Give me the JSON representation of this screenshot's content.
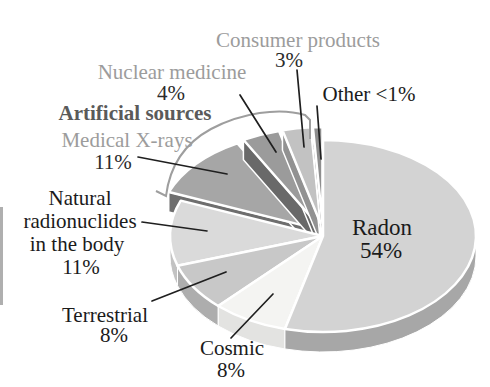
{
  "chart_data": {
    "type": "pie",
    "title": "",
    "style": "3d-exploded-pie",
    "legend_position": "callout-labels",
    "total": 100,
    "group_label": {
      "text": "Artificial sources",
      "color": "#5a5a5a"
    },
    "slices": [
      {
        "id": "radon",
        "label": "Radon",
        "label_lines": [
          "Radon"
        ],
        "pct": "54%",
        "value": 54,
        "value_display": "54%",
        "exploded": false,
        "color_top": "#d3d3d3",
        "color_side": "#a7a7a7",
        "label_color": "#1b1b1b",
        "pct_color": "#1b1b1b"
      },
      {
        "id": "cosmic",
        "label": "Cosmic",
        "label_lines": [
          "Cosmic"
        ],
        "pct": "8%",
        "value": 8,
        "value_display": "8%",
        "exploded": false,
        "color_top": "#f4f4f2",
        "color_side": "#e3e3e1",
        "label_color": "#1b1b1b",
        "pct_color": "#1b1b1b"
      },
      {
        "id": "terrestrial",
        "label": "Terrestrial",
        "label_lines": [
          "Terrestrial"
        ],
        "pct": "8%",
        "value": 8,
        "value_display": "8%",
        "exploded": false,
        "color_top": "#c8c8c8",
        "color_side": "#adadad",
        "label_color": "#1b1b1b",
        "pct_color": "#1b1b1b"
      },
      {
        "id": "natural",
        "label": "Natural radionuclides in the body",
        "label_lines": [
          "Natural",
          "radionuclides",
          "in the body"
        ],
        "pct": "11%",
        "value": 11,
        "value_display": "11%",
        "exploded": false,
        "color_top": "#dadada",
        "color_side": "#c2c2c2",
        "label_color": "#1b1b1b",
        "pct_color": "#1b1b1b"
      },
      {
        "id": "medical",
        "label": "Medical X-rays",
        "label_lines": [
          "Medical X-rays"
        ],
        "pct": "11%",
        "value": 11,
        "value_display": "11%",
        "exploded": true,
        "color_top": "#a6a6a6",
        "color_side": "#6e6e6e",
        "label_color": "#9c9c9c",
        "pct_color": "#2b2b2b"
      },
      {
        "id": "nuclear",
        "label": "Nuclear medicine",
        "label_lines": [
          "Nuclear medicine"
        ],
        "pct": "4%",
        "value": 4,
        "value_display": "4%",
        "exploded": true,
        "color_top": "#9b9b9b",
        "color_side": "#696969",
        "label_color": "#9c9c9c",
        "pct_color": "#2b2b2b"
      },
      {
        "id": "consumer",
        "label": "Consumer products",
        "label_lines": [
          "Consumer products"
        ],
        "pct": "3%",
        "value": 3,
        "value_display": "3%",
        "exploded": true,
        "color_top": "#c2c2c2",
        "color_side": "#929292",
        "label_color": "#9c9c9c",
        "pct_color": "#2b2b2b"
      },
      {
        "id": "other",
        "label": "Other <1%",
        "label_lines": [
          "Other <1%"
        ],
        "pct": "",
        "value": 1,
        "value_display": "<1%",
        "exploded": true,
        "color_top": "#8e8e8e",
        "color_side": "#757575",
        "label_color": "#1b1b1b",
        "pct_color": "#1b1b1b"
      }
    ],
    "colors": {
      "background": "#ffffff",
      "leader_line": "#1f1f1f",
      "slice_gap": "#ffffff",
      "bracket": "#9e9e9e",
      "scan_artifact": "#949494"
    }
  }
}
